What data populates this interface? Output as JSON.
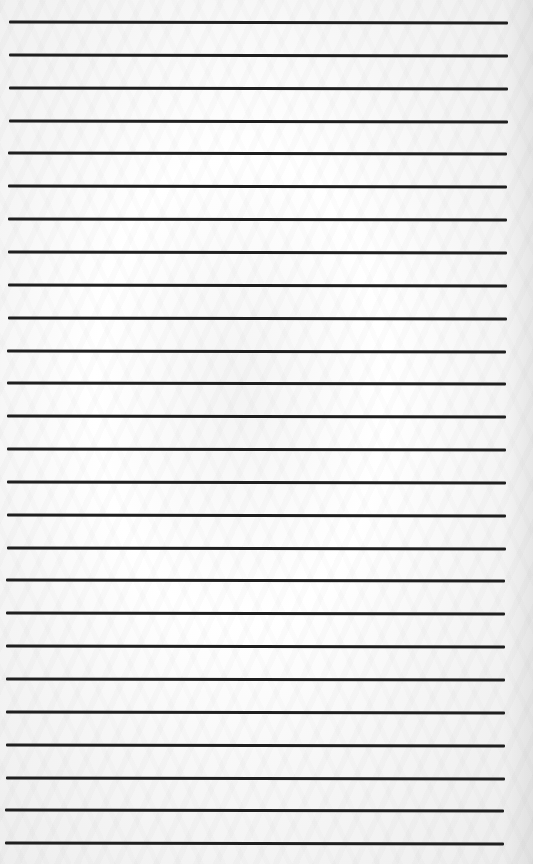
{
  "page": {
    "type": "lined-paper",
    "line_color": "#1f1f1f",
    "background_color": "#fafafa",
    "line_count": 26,
    "first_line_y": 21,
    "line_spacing": 32.85,
    "line_left": 9,
    "line_right": 508
  }
}
